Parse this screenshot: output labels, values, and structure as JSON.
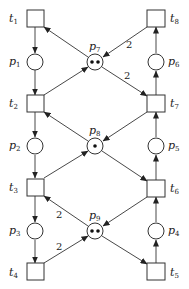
{
  "diagram": {
    "type": "petri-net",
    "places": [
      {
        "id": "p1",
        "label": "p",
        "sub": "1",
        "tokens": 0
      },
      {
        "id": "p2",
        "label": "p",
        "sub": "2",
        "tokens": 0
      },
      {
        "id": "p3",
        "label": "p",
        "sub": "3",
        "tokens": 0
      },
      {
        "id": "p4",
        "label": "p",
        "sub": "4",
        "tokens": 0
      },
      {
        "id": "p5",
        "label": "p",
        "sub": "5",
        "tokens": 0
      },
      {
        "id": "p6",
        "label": "p",
        "sub": "6",
        "tokens": 0
      },
      {
        "id": "p7",
        "label": "p",
        "sub": "7",
        "tokens": 2
      },
      {
        "id": "p8",
        "label": "p",
        "sub": "8",
        "tokens": 1
      },
      {
        "id": "p9",
        "label": "p",
        "sub": "9",
        "tokens": 2
      }
    ],
    "transitions": [
      {
        "id": "t1",
        "label": "t",
        "sub": "1"
      },
      {
        "id": "t2",
        "label": "t",
        "sub": "2"
      },
      {
        "id": "t3",
        "label": "t",
        "sub": "3"
      },
      {
        "id": "t4",
        "label": "t",
        "sub": "4"
      },
      {
        "id": "t5",
        "label": "t",
        "sub": "5"
      },
      {
        "id": "t6",
        "label": "t",
        "sub": "6"
      },
      {
        "id": "t7",
        "label": "t",
        "sub": "7"
      },
      {
        "id": "t8",
        "label": "t",
        "sub": "8"
      }
    ],
    "arcs": [
      {
        "from": "t1",
        "to": "p1",
        "weight": 1
      },
      {
        "from": "p1",
        "to": "t2",
        "weight": 1
      },
      {
        "from": "t2",
        "to": "p2",
        "weight": 1
      },
      {
        "from": "p2",
        "to": "t3",
        "weight": 1
      },
      {
        "from": "t3",
        "to": "p3",
        "weight": 1
      },
      {
        "from": "p3",
        "to": "t4",
        "weight": 1
      },
      {
        "from": "t5",
        "to": "p4",
        "weight": 1
      },
      {
        "from": "p4",
        "to": "t6",
        "weight": 1
      },
      {
        "from": "t6",
        "to": "p5",
        "weight": 1
      },
      {
        "from": "p5",
        "to": "t7",
        "weight": 1
      },
      {
        "from": "t7",
        "to": "p6",
        "weight": 1
      },
      {
        "from": "p6",
        "to": "t8",
        "weight": 1
      },
      {
        "from": "p7",
        "to": "t1",
        "weight": 1
      },
      {
        "from": "t8",
        "to": "p7",
        "weight": 2
      },
      {
        "from": "t2",
        "to": "p7",
        "weight": 1
      },
      {
        "from": "p7",
        "to": "t7",
        "weight": 2
      },
      {
        "from": "p8",
        "to": "t2",
        "weight": 1
      },
      {
        "from": "t7",
        "to": "p8",
        "weight": 1
      },
      {
        "from": "t3",
        "to": "p8",
        "weight": 1
      },
      {
        "from": "p8",
        "to": "t6",
        "weight": 1
      },
      {
        "from": "p9",
        "to": "t3",
        "weight": 2
      },
      {
        "from": "t6",
        "to": "p9",
        "weight": 1
      },
      {
        "from": "t4",
        "to": "p9",
        "weight": 2
      },
      {
        "from": "p9",
        "to": "t5",
        "weight": 1
      }
    ],
    "weight_labels": [
      "2",
      "2",
      "2",
      "2"
    ]
  }
}
